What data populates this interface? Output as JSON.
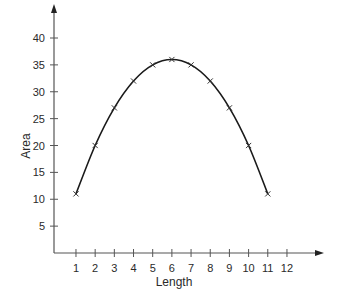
{
  "chart_data": {
    "type": "line",
    "title": "",
    "xlabel": "Length",
    "ylabel": "Area",
    "x": [
      1,
      2,
      3,
      4,
      5,
      6,
      7,
      8,
      9,
      10,
      11
    ],
    "values": [
      11,
      20,
      27,
      32,
      35,
      36,
      35,
      32,
      27,
      20,
      11
    ],
    "series": [
      {
        "name": "Area",
        "x": [
          1,
          2,
          3,
          4,
          5,
          6,
          7,
          8,
          9,
          10,
          11
        ],
        "values": [
          11,
          20,
          27,
          32,
          35,
          36,
          35,
          32,
          27,
          20,
          11
        ],
        "marker": "x",
        "line": "smooth"
      }
    ],
    "xticks": [
      1,
      2,
      3,
      4,
      5,
      6,
      7,
      8,
      9,
      10,
      11,
      12
    ],
    "yticks": [
      5,
      10,
      15,
      20,
      25,
      30,
      35,
      40
    ],
    "xlim": [
      0,
      12
    ],
    "ylim": [
      0,
      40
    ],
    "grid": false,
    "legend": null,
    "axis_arrows": true,
    "colors": {
      "line": "#1a1a1a",
      "axis": "#555555",
      "text": "#2a2a2a",
      "background": "#ffffff"
    }
  }
}
